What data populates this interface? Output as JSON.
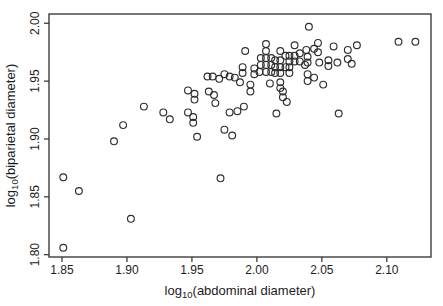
{
  "figure": {
    "background": "#ffffff",
    "frame_color": "#2e2e2e",
    "tick_color": "#2e2e2e",
    "text_color": "#1c1c1c"
  },
  "chart_data": {
    "type": "scatter",
    "title": "",
    "xlabel_prefix": "log",
    "xlabel_sub": "10",
    "xlabel_rest": "(abdominal diameter)",
    "ylabel_prefix": "log",
    "ylabel_sub": "10",
    "ylabel_rest": "(biparietal diameter)",
    "xlim": [
      1.84,
      2.134
    ],
    "ylim": [
      1.798,
      2.008
    ],
    "xticks": [
      "1.85",
      "1.90",
      "1.95",
      "2.00",
      "2.05",
      "2.10"
    ],
    "yticks": [
      "1.80",
      "1.85",
      "1.90",
      "1.95",
      "2.00"
    ],
    "grid": false,
    "legend": null,
    "marker": "open-circle",
    "marker_color": "#2e2e2e",
    "marker_radius": 3.4,
    "points": [
      [
        1.851,
        1.806
      ],
      [
        1.851,
        1.867
      ],
      [
        1.863,
        1.855
      ],
      [
        1.903,
        1.831
      ],
      [
        1.89,
        1.898
      ],
      [
        1.897,
        1.912
      ],
      [
        1.913,
        1.928
      ],
      [
        1.928,
        1.923
      ],
      [
        1.933,
        1.917
      ],
      [
        1.947,
        1.942
      ],
      [
        1.952,
        1.939
      ],
      [
        1.952,
        1.934
      ],
      [
        1.947,
        1.923
      ],
      [
        1.951,
        1.919
      ],
      [
        1.951,
        1.914
      ],
      [
        1.954,
        1.902
      ],
      [
        1.962,
        1.954
      ],
      [
        1.966,
        1.954
      ],
      [
        1.971,
        1.952
      ],
      [
        1.975,
        1.956
      ],
      [
        1.979,
        1.954
      ],
      [
        1.983,
        1.953
      ],
      [
        1.963,
        1.941
      ],
      [
        1.967,
        1.938
      ],
      [
        1.968,
        1.931
      ],
      [
        1.975,
        1.908
      ],
      [
        1.981,
        1.903
      ],
      [
        1.972,
        1.866
      ],
      [
        1.991,
        1.976
      ],
      [
        2.007,
        1.982
      ],
      [
        2.007,
        1.976
      ],
      [
        2.007,
        1.97
      ],
      [
        2.007,
        1.964
      ],
      [
        2.007,
        1.958
      ],
      [
        2.003,
        1.97
      ],
      [
        2.003,
        1.964
      ],
      [
        2.002,
        1.958
      ],
      [
        1.989,
        1.962
      ],
      [
        1.989,
        1.957
      ],
      [
        1.998,
        1.961
      ],
      [
        1.998,
        1.956
      ],
      [
        1.987,
        1.949
      ],
      [
        1.995,
        1.947
      ],
      [
        1.995,
        1.941
      ],
      [
        2.011,
        1.97
      ],
      [
        2.011,
        1.964
      ],
      [
        2.011,
        1.958
      ],
      [
        2.01,
        1.948
      ],
      [
        2.029,
        1.981
      ],
      [
        2.018,
        1.976
      ],
      [
        2.022,
        1.972
      ],
      [
        2.025,
        1.972
      ],
      [
        2.029,
        1.972
      ],
      [
        2.033,
        1.974
      ],
      [
        2.038,
        1.977
      ],
      [
        2.014,
        1.968
      ],
      [
        2.018,
        1.968
      ],
      [
        2.025,
        1.967
      ],
      [
        2.029,
        1.967
      ],
      [
        2.033,
        1.967
      ],
      [
        2.014,
        1.962
      ],
      [
        2.018,
        1.962
      ],
      [
        2.022,
        1.962
      ],
      [
        2.025,
        1.962
      ],
      [
        2.037,
        1.964
      ],
      [
        2.014,
        1.957
      ],
      [
        2.018,
        1.957
      ],
      [
        2.025,
        1.957
      ],
      [
        2.018,
        1.949
      ],
      [
        2.018,
        1.944
      ],
      [
        2.02,
        1.941
      ],
      [
        2.02,
        1.936
      ],
      [
        2.023,
        1.932
      ],
      [
        1.99,
        1.928
      ],
      [
        1.985,
        1.924
      ],
      [
        1.979,
        1.923
      ],
      [
        2.015,
        1.922
      ],
      [
        2.04,
        1.997
      ],
      [
        2.047,
        1.983
      ],
      [
        2.044,
        1.978
      ],
      [
        2.047,
        1.975
      ],
      [
        2.059,
        1.98
      ],
      [
        2.07,
        1.977
      ],
      [
        2.077,
        1.981
      ],
      [
        2.039,
        1.971
      ],
      [
        2.039,
        1.966
      ],
      [
        2.048,
        1.966
      ],
      [
        2.055,
        1.968
      ],
      [
        2.055,
        1.963
      ],
      [
        2.062,
        1.966
      ],
      [
        2.07,
        1.969
      ],
      [
        2.073,
        1.965
      ],
      [
        2.039,
        1.956
      ],
      [
        2.039,
        1.95
      ],
      [
        2.044,
        1.953
      ],
      [
        2.051,
        1.947
      ],
      [
        2.063,
        1.922
      ],
      [
        2.109,
        1.984
      ],
      [
        2.122,
        1.984
      ]
    ]
  }
}
